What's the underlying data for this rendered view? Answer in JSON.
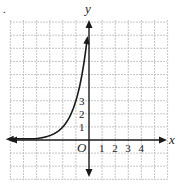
{
  "figure_marker": ".",
  "chart_data": {
    "type": "line",
    "title": "",
    "xlabel": "x",
    "ylabel": "y",
    "origin_label": "O",
    "x_tick_labels": [
      "1",
      "2",
      "3",
      "4"
    ],
    "y_tick_labels": [
      "1",
      "2",
      "3"
    ],
    "xlim": [
      -6,
      6
    ],
    "ylim": [
      -3,
      9
    ],
    "grid": true,
    "legend": null,
    "series": [
      {
        "name": "f(x) = 3^(x+2)",
        "x": [
          -6,
          -5,
          -4,
          -3,
          -2,
          -1.5,
          -1,
          -0.5,
          -0.1
        ],
        "y": [
          0.012,
          0.037,
          0.111,
          0.333,
          1,
          1.732,
          3,
          5.196,
          8.06
        ]
      }
    ],
    "annotations": [
      "Curve has arrowheads at both ends; asymptote y=0 on the left"
    ]
  },
  "colors": {
    "axis": "#1a1a1a",
    "curve": "#1a1a1a",
    "grid": "#b8b8b8",
    "background": "#ffffff"
  }
}
